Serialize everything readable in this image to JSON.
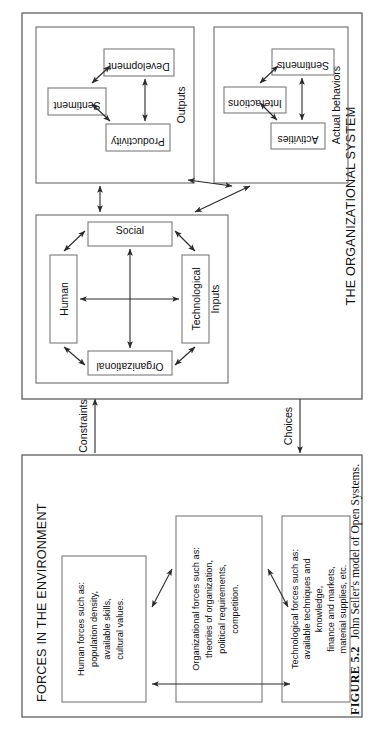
{
  "figure": {
    "caption_label": "FIGURE 5.2",
    "caption_text": "John Seiler's model of Open Systems.",
    "orientation": "rotated-90-ccw",
    "page_background": "#ffffff"
  },
  "colors": {
    "frame_stroke": "#4a4a4a",
    "group_stroke": "#6b6b6b",
    "node_stroke": "#7a7a7a",
    "connector": "#2a2a2a",
    "text": "#111111"
  },
  "diagram": {
    "type": "block-flow-diagram",
    "frames": [
      {
        "id": "environment",
        "title": "FORCES IN THE ENVIRONMENT",
        "nodes": [
          {
            "id": "human-forces",
            "lines": [
              "Human forces such as:",
              "population density,",
              "available skills,",
              "cultural values."
            ]
          },
          {
            "id": "organizational-forces",
            "lines": [
              "Organizational forces such as:",
              "theories of organization,",
              "political requirements,",
              "competition."
            ]
          },
          {
            "id": "technological-forces",
            "lines": [
              "Technological forces such as:",
              "available techniques and",
              "knowledge,",
              "finance and markets,",
              "material supplies, etc."
            ]
          }
        ]
      },
      {
        "id": "organizational-system",
        "title": "THE ORGANIZATIONAL SYSTEM",
        "groups": [
          {
            "id": "inputs",
            "title": "Inputs",
            "nodes": [
              {
                "id": "human",
                "label": "Human"
              },
              {
                "id": "social",
                "label": "Social"
              },
              {
                "id": "technological",
                "label": "Technological"
              },
              {
                "id": "organizational",
                "label": "Organizational"
              }
            ]
          },
          {
            "id": "actual-behaviors",
            "title": "Actual behaviors",
            "nodes": [
              {
                "id": "activities",
                "label": "Activities"
              },
              {
                "id": "interactions",
                "label": "Interactions"
              },
              {
                "id": "sentiments",
                "label": "Sentiments"
              }
            ]
          },
          {
            "id": "outputs",
            "title": "Outputs",
            "nodes": [
              {
                "id": "productivity",
                "label": "Productivity"
              },
              {
                "id": "sentiment",
                "label": "Sentiment"
              },
              {
                "id": "development",
                "label": "Development"
              }
            ]
          }
        ]
      }
    ],
    "flows": [
      {
        "id": "constraints",
        "label": "Constraints",
        "direction": "environment-to-system"
      },
      {
        "id": "choices",
        "label": "Choices",
        "direction": "system-to-environment"
      }
    ]
  }
}
